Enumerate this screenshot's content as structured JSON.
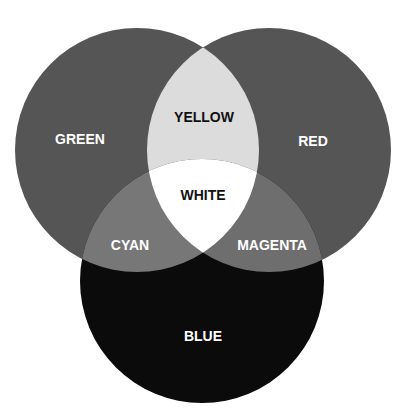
{
  "diagram": {
    "type": "venn",
    "title": "",
    "circles": [
      {
        "id": "green",
        "label": "GREEN",
        "cx": 137,
        "cy": 150,
        "r": 122,
        "fill": "#555555",
        "label_color": "#ffffff",
        "label_x": 80,
        "label_y": 139
      },
      {
        "id": "red",
        "label": "RED",
        "cx": 269,
        "cy": 150,
        "r": 122,
        "fill": "#555555",
        "label_color": "#ffffff",
        "label_x": 313,
        "label_y": 141
      },
      {
        "id": "blue",
        "label": "BLUE",
        "cx": 202,
        "cy": 281,
        "r": 122,
        "fill": "#0b0b0b",
        "label_color": "#ffffff",
        "label_x": 203,
        "label_y": 336
      }
    ],
    "overlaps": [
      {
        "id": "yellow",
        "label": "YELLOW",
        "sets": [
          "green",
          "red"
        ],
        "fill": "#dcdcdc",
        "label_color": "#111111",
        "label_x": 204,
        "label_y": 117
      },
      {
        "id": "cyan",
        "label": "CYAN",
        "sets": [
          "green",
          "blue"
        ],
        "fill": "#777777",
        "label_color": "#ffffff",
        "label_x": 130,
        "label_y": 245
      },
      {
        "id": "magenta",
        "label": "MAGENTA",
        "sets": [
          "red",
          "blue"
        ],
        "fill": "#6e6e6e",
        "label_color": "#ffffff",
        "label_x": 272,
        "label_y": 245
      },
      {
        "id": "white",
        "label": "WHITE",
        "sets": [
          "green",
          "red",
          "blue"
        ],
        "fill": "#ffffff",
        "label_color": "#111111",
        "label_x": 203,
        "label_y": 195
      }
    ]
  },
  "labels": {
    "green": "GREEN",
    "red": "RED",
    "blue": "BLUE",
    "yellow": "YELLOW",
    "cyan": "CYAN",
    "magenta": "MAGENTA",
    "white": "WHITE"
  }
}
